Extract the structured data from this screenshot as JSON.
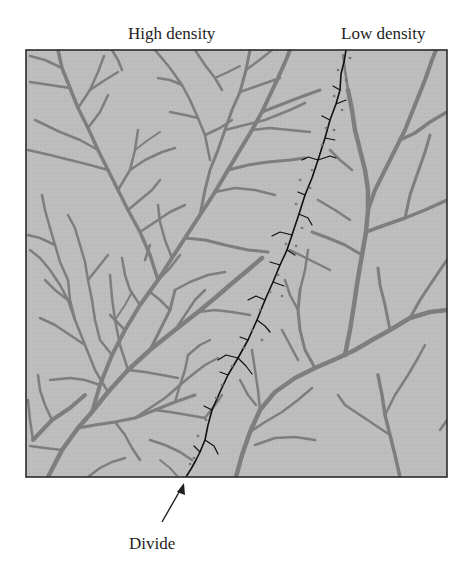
{
  "figure": {
    "labels": {
      "high_density": "High density",
      "low_density": "Low density",
      "divide": "Divide"
    },
    "colors": {
      "background": "#ffffff",
      "terrain_fill": "#bdbdbd",
      "stream": "#7e7e7e",
      "divide_line": "#111111",
      "frame": "#2a2a2a",
      "text": "#1e1e1e"
    },
    "frame": {
      "x": 26,
      "y": 50,
      "width": 421,
      "height": 427
    },
    "divide_path": [
      [
        346,
        50
      ],
      [
        340,
        90
      ],
      [
        330,
        120
      ],
      [
        318,
        160
      ],
      [
        305,
        195
      ],
      [
        292,
        235
      ],
      [
        280,
        265
      ],
      [
        265,
        300
      ],
      [
        248,
        340
      ],
      [
        228,
        375
      ],
      [
        212,
        410
      ],
      [
        205,
        440
      ],
      [
        196,
        460
      ],
      [
        186,
        477
      ]
    ],
    "divide_arrow": {
      "from": [
        162,
        522
      ],
      "to": [
        184,
        483
      ]
    }
  }
}
